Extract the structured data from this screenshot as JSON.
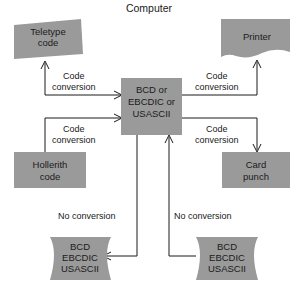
{
  "diagram": {
    "title": "Computer",
    "theme": {
      "node_fill": "#9a9a9a",
      "line_color": "#1a1a1a",
      "background": "#ffffff",
      "text_color": "#1a1a1a"
    },
    "nodes": [
      {
        "id": "teletype-code",
        "shape": "skewed-paper",
        "lines": [
          "Teletype",
          "code"
        ]
      },
      {
        "id": "printer",
        "shape": "torn-document",
        "lines": [
          "Printer"
        ]
      },
      {
        "id": "central-processor",
        "shape": "rectangle",
        "lines": [
          "BCD or",
          "EBCDIC or",
          "USASCII"
        ]
      },
      {
        "id": "hollerith-code",
        "shape": "rectangle",
        "lines": [
          "Hollerith",
          "code"
        ]
      },
      {
        "id": "card-punch",
        "shape": "rectangle",
        "lines": [
          "Card",
          "punch"
        ]
      },
      {
        "id": "tape-left",
        "shape": "wavy-tape",
        "lines": [
          "BCD",
          "EBCDIC",
          "USASCII"
        ]
      },
      {
        "id": "tape-right",
        "shape": "wavy-tape",
        "lines": [
          "BCD",
          "EBCDIC",
          "USASCII"
        ]
      }
    ],
    "edges": [
      {
        "id": "edge-to-teletype",
        "from": "central-processor",
        "to": "teletype-code",
        "label_lines": [
          "Code",
          "conversion"
        ]
      },
      {
        "id": "edge-to-printer",
        "from": "central-processor",
        "to": "printer",
        "label_lines": [
          "Code",
          "conversion"
        ]
      },
      {
        "id": "edge-from-hollerith",
        "from": "hollerith-code",
        "to": "central-processor",
        "label_lines": [
          "Code",
          "conversion"
        ]
      },
      {
        "id": "edge-to-card-punch",
        "from": "central-processor",
        "to": "card-punch",
        "label_lines": [
          "Code",
          "conversion"
        ]
      },
      {
        "id": "edge-to-tape-left",
        "from": "central-processor",
        "to": "tape-left",
        "label_lines": [
          "No conversion"
        ]
      },
      {
        "id": "edge-from-tape-right",
        "from": "tape-right",
        "to": "central-processor",
        "label_lines": [
          "No conversion"
        ]
      }
    ]
  }
}
